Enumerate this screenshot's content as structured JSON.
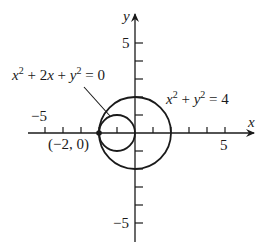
{
  "diagram": {
    "axes": {
      "x_label": "x",
      "y_label": "y",
      "x_tick_label_neg": "−5",
      "x_tick_label_pos": "5",
      "y_tick_label_pos": "5",
      "y_tick_label_neg": "−5",
      "x_range": [
        -6,
        7
      ],
      "y_range": [
        -6,
        6
      ]
    },
    "curves": [
      {
        "equation_parts": [
          "x",
          "2",
          " + 2",
          "x",
          " + ",
          "y",
          "2",
          " = 0"
        ],
        "center": [
          -1,
          0
        ],
        "radius": 1
      },
      {
        "equation_parts": [
          "x",
          "2",
          " + ",
          "y",
          "2",
          " = 4"
        ],
        "center": [
          0,
          0
        ],
        "radius": 2
      }
    ],
    "point": {
      "label": "(−2, 0)",
      "coords": [
        -2,
        0
      ]
    },
    "colors": {
      "stroke": "#1a1a1a",
      "background": "#ffffff"
    }
  }
}
